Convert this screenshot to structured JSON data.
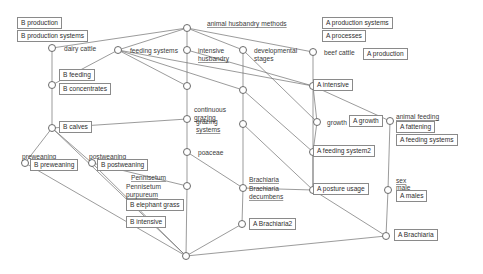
{
  "diagram": {
    "type": "hasse-lattice",
    "edge_color": "#707070",
    "node_stroke": "#6b6b6b",
    "box_stroke": "#8a8a8a",
    "text_color": "#333333"
  },
  "nodes": [
    {
      "id": "top",
      "x": 187,
      "y": 28,
      "labels": []
    },
    {
      "id": "dairy_cattle",
      "x": 52,
      "y": 48,
      "labels": [
        "dairy cattle"
      ]
    },
    {
      "id": "feeding_systems",
      "x": 118,
      "y": 50,
      "labels": [
        "feeding systems"
      ]
    },
    {
      "id": "intensive_husb",
      "x": 187,
      "y": 50,
      "labels": [
        "intensive",
        "husbandry"
      ]
    },
    {
      "id": "dev_stages",
      "x": 243,
      "y": 50,
      "labels": [
        "developmental",
        "stages"
      ]
    },
    {
      "id": "beef_cattle",
      "x": 313,
      "y": 52,
      "labels": [
        "beef cattle"
      ]
    },
    {
      "id": "b_feeding",
      "x": 52,
      "y": 85,
      "labels": []
    },
    {
      "id": "n_187_86",
      "x": 187,
      "y": 86,
      "labels": []
    },
    {
      "id": "n_243_90",
      "x": 243,
      "y": 90,
      "labels": []
    },
    {
      "id": "a_intensive",
      "x": 313,
      "y": 86,
      "labels": []
    },
    {
      "id": "grazing_systems",
      "x": 187,
      "y": 119,
      "labels": [
        "continuous",
        "grazing",
        "grazing",
        "systems"
      ]
    },
    {
      "id": "b_calves",
      "x": 52,
      "y": 128,
      "labels": []
    },
    {
      "id": "n_243_124",
      "x": 243,
      "y": 124,
      "labels": []
    },
    {
      "id": "growth",
      "x": 317,
      "y": 122,
      "labels": [
        "growth"
      ]
    },
    {
      "id": "a_fattening",
      "x": 390,
      "y": 121,
      "labels": [
        "animal feeding",
        "fattening"
      ]
    },
    {
      "id": "poaceae",
      "x": 187,
      "y": 152,
      "labels": [
        "poaceae"
      ]
    },
    {
      "id": "preweaning",
      "x": 25,
      "y": 163,
      "labels": [
        "preweaning"
      ]
    },
    {
      "id": "postweaning",
      "x": 92,
      "y": 163,
      "labels": [
        "postweaning"
      ]
    },
    {
      "id": "a_feeding_sys2",
      "x": 313,
      "y": 152,
      "labels": []
    },
    {
      "id": "pennisetum",
      "x": 187,
      "y": 186,
      "labels": [
        "Pennisetum",
        "Pennisetum",
        "purpureum"
      ]
    },
    {
      "id": "brachiaria",
      "x": 243,
      "y": 188,
      "labels": [
        "Brachiaria",
        "Brachiaria",
        "decumbens"
      ]
    },
    {
      "id": "a_posture",
      "x": 313,
      "y": 190,
      "labels": []
    },
    {
      "id": "a_males",
      "x": 388,
      "y": 190,
      "labels": [
        "sex",
        "male"
      ]
    },
    {
      "id": "a_brachiaria2",
      "x": 242,
      "y": 224,
      "labels": []
    },
    {
      "id": "a_brachiaria",
      "x": 386,
      "y": 236,
      "labels": []
    },
    {
      "id": "bottom",
      "x": 186,
      "y": 256,
      "labels": []
    }
  ],
  "edges": [
    [
      "top",
      "dairy_cattle"
    ],
    [
      "top",
      "feeding_systems"
    ],
    [
      "top",
      "intensive_husb"
    ],
    [
      "top",
      "dev_stages"
    ],
    [
      "top",
      "beef_cattle"
    ],
    [
      "dairy_cattle",
      "b_feeding"
    ],
    [
      "feeding_systems",
      "b_feeding"
    ],
    [
      "feeding_systems",
      "n_187_86"
    ],
    [
      "feeding_systems",
      "n_243_90"
    ],
    [
      "feeding_systems",
      "a_intensive"
    ],
    [
      "intensive_husb",
      "n_187_86"
    ],
    [
      "intensive_husb",
      "a_intensive"
    ],
    [
      "dev_stages",
      "n_243_90"
    ],
    [
      "dev_stages",
      "growth"
    ],
    [
      "beef_cattle",
      "a_intensive"
    ],
    [
      "b_feeding",
      "b_calves"
    ],
    [
      "n_187_86",
      "grazing_systems"
    ],
    [
      "n_243_90",
      "n_243_124"
    ],
    [
      "n_243_90",
      "a_feeding_sys2"
    ],
    [
      "a_intensive",
      "growth"
    ],
    [
      "a_intensive",
      "a_fattening"
    ],
    [
      "a_intensive",
      "a_posture"
    ],
    [
      "grazing_systems",
      "poaceae"
    ],
    [
      "grazing_systems",
      "b_calves"
    ],
    [
      "b_calves",
      "preweaning"
    ],
    [
      "b_calves",
      "postweaning"
    ],
    [
      "n_243_124",
      "brachiaria"
    ],
    [
      "n_243_124",
      "a_posture"
    ],
    [
      "growth",
      "a_feeding_sys2"
    ],
    [
      "a_fattening",
      "a_males"
    ],
    [
      "poaceae",
      "pennisetum"
    ],
    [
      "poaceae",
      "brachiaria"
    ],
    [
      "preweaning",
      "bottom"
    ],
    [
      "postweaning",
      "pennisetum"
    ],
    [
      "a_feeding_sys2",
      "a_posture"
    ],
    [
      "pennisetum",
      "bottom"
    ],
    [
      "brachiaria",
      "a_brachiaria2"
    ],
    [
      "brachiaria",
      "a_posture"
    ],
    [
      "a_posture",
      "a_brachiaria"
    ],
    [
      "a_males",
      "a_brachiaria"
    ],
    [
      "a_brachiaria2",
      "bottom"
    ],
    [
      "a_brachiaria",
      "bottom"
    ],
    [
      "postweaning",
      "bottom"
    ],
    [
      "b_calves",
      "bottom"
    ]
  ],
  "plain_labels": [
    {
      "id": "animal-husbandry-methods",
      "text": "animal husbandry methods",
      "x": 207,
      "y": 20,
      "underline": true
    },
    {
      "id": "dairy-cattle",
      "text": "dairy cattle",
      "x": 64,
      "y": 45,
      "underline": false
    },
    {
      "id": "feeding-systems",
      "text": "feeding systems",
      "x": 130,
      "y": 47,
      "underline": false
    },
    {
      "id": "intensive",
      "text": "intensive",
      "x": 198,
      "y": 47,
      "underline": false
    },
    {
      "id": "husbandry",
      "text": "husbandry",
      "x": 198,
      "y": 55,
      "underline": true
    },
    {
      "id": "developmental",
      "text": "developmental",
      "x": 254,
      "y": 47,
      "underline": false
    },
    {
      "id": "stages",
      "text": "stages",
      "x": 254,
      "y": 55,
      "underline": false
    },
    {
      "id": "beef-cattle",
      "text": "beef cattle",
      "x": 324,
      "y": 49,
      "underline": false
    },
    {
      "id": "continuous",
      "text": "continuous",
      "x": 194,
      "y": 106,
      "underline": false
    },
    {
      "id": "grazing-1",
      "text": "grazing",
      "x": 194,
      "y": 114,
      "underline": true
    },
    {
      "id": "grazing-2",
      "text": "grazing",
      "x": 196,
      "y": 118,
      "underline": false
    },
    {
      "id": "grazing-systems",
      "text": "systems",
      "x": 196,
      "y": 126,
      "underline": true
    },
    {
      "id": "growth",
      "text": "growth",
      "x": 327,
      "y": 119,
      "underline": false
    },
    {
      "id": "animal-feeding",
      "text": "animal feeding",
      "x": 396,
      "y": 113,
      "underline": true
    },
    {
      "id": "fattening",
      "text": "fattening",
      "x": 396,
      "y": 120,
      "underline": true
    },
    {
      "id": "poaceae",
      "text": "poaceae",
      "x": 198,
      "y": 149,
      "underline": false
    },
    {
      "id": "preweaning",
      "text": "preweaning",
      "x": 22,
      "y": 153,
      "underline": false
    },
    {
      "id": "postweaning",
      "text": "postweaning",
      "x": 89,
      "y": 153,
      "underline": false
    },
    {
      "id": "pennisetum-1",
      "text": "Pennisetum",
      "x": 131,
      "y": 174,
      "underline": true
    },
    {
      "id": "pennisetum-2",
      "text": "Pennisetum",
      "x": 126,
      "y": 183,
      "underline": false
    },
    {
      "id": "purpureum",
      "text": "purpureum",
      "x": 126,
      "y": 191,
      "underline": true
    },
    {
      "id": "brachiaria-1",
      "text": "Brachiaria",
      "x": 249,
      "y": 176,
      "underline": true
    },
    {
      "id": "brachiaria-2",
      "text": "Brachiaria",
      "x": 249,
      "y": 185,
      "underline": false
    },
    {
      "id": "decumbens",
      "text": "decumbens",
      "x": 249,
      "y": 193,
      "underline": true
    },
    {
      "id": "sex",
      "text": "sex",
      "x": 396,
      "y": 177,
      "underline": true
    },
    {
      "id": "male",
      "text": "male",
      "x": 396,
      "y": 184,
      "underline": false
    }
  ],
  "boxed_labels": [
    {
      "id": "b-production",
      "text": "B production",
      "x": 17,
      "y": 17
    },
    {
      "id": "b-production-systems",
      "text": "B production systems",
      "x": 17,
      "y": 30
    },
    {
      "id": "a-production-systems",
      "text": "A production systems",
      "x": 322,
      "y": 17
    },
    {
      "id": "a-processes",
      "text": "A processes",
      "x": 322,
      "y": 30
    },
    {
      "id": "a-production",
      "text": "A production",
      "x": 363,
      "y": 48
    },
    {
      "id": "b-feeding",
      "text": "B feeding",
      "x": 59,
      "y": 69
    },
    {
      "id": "b-concentrates",
      "text": "B concentrates",
      "x": 59,
      "y": 83
    },
    {
      "id": "a-intensive",
      "text": "A intensive",
      "x": 313,
      "y": 79
    },
    {
      "id": "a-growth",
      "text": "A growth",
      "x": 349,
      "y": 115
    },
    {
      "id": "a-fattening",
      "text": "A fattening",
      "x": 396,
      "y": 121
    },
    {
      "id": "a-feeding-systems",
      "text": "A feeding systems",
      "x": 396,
      "y": 134
    },
    {
      "id": "b-calves",
      "text": "B calves",
      "x": 59,
      "y": 121
    },
    {
      "id": "b-preweaning",
      "text": "B preweaning",
      "x": 30,
      "y": 159
    },
    {
      "id": "b-postweaning",
      "text": "B postweaning",
      "x": 97,
      "y": 159
    },
    {
      "id": "a-feeding-system2",
      "text": "A feeding system2",
      "x": 313,
      "y": 145
    },
    {
      "id": "a-posture-usage",
      "text": "A posture usage",
      "x": 313,
      "y": 183
    },
    {
      "id": "a-males",
      "text": "A males",
      "x": 396,
      "y": 190
    },
    {
      "id": "b-elephant-grass",
      "text": "B elephant grass",
      "x": 126,
      "y": 199
    },
    {
      "id": "b-intensive",
      "text": "B intensive",
      "x": 126,
      "y": 216
    },
    {
      "id": "a-brachiaria2",
      "text": "A Brachiaria2",
      "x": 249,
      "y": 218
    },
    {
      "id": "a-brachiaria",
      "text": "A Brachiaria",
      "x": 394,
      "y": 229
    }
  ]
}
